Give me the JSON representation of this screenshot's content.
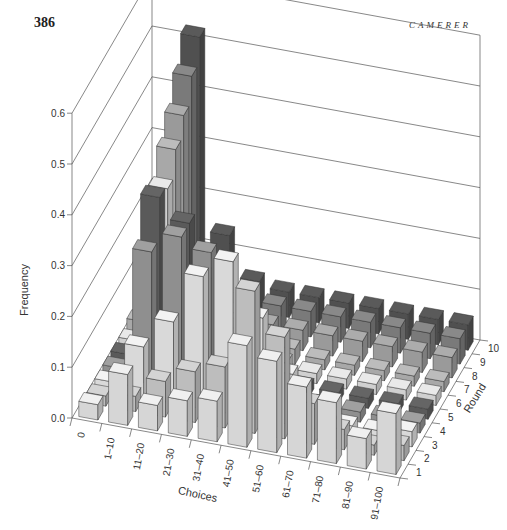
{
  "header": {
    "page_number": "386",
    "running_head": "CAMERER"
  },
  "caption": "",
  "chart_data": {
    "type": "bar3d",
    "title": "",
    "xlabel": "Choices",
    "ylabel": "Round",
    "zlabel": "Frequency",
    "x_categories": [
      "0",
      "1–10",
      "11–20",
      "21–30",
      "31–40",
      "41–50",
      "51–60",
      "61–70",
      "71–80",
      "81–90",
      "91–100"
    ],
    "y_categories": [
      "1",
      "2",
      "3",
      "4",
      "5",
      "6",
      "7",
      "8",
      "9",
      "10"
    ],
    "z_ticks": [
      "0.0",
      "0.1",
      "0.2",
      "0.3",
      "0.4",
      "0.5",
      "0.6"
    ],
    "zlim": [
      0,
      0.6
    ],
    "grid": true,
    "series": [
      {
        "name": "Round 1",
        "values": [
          0.03,
          0.1,
          0.05,
          0.07,
          0.08,
          0.2,
          0.18,
          0.14,
          0.12,
          0.06,
          0.12
        ]
      },
      {
        "name": "Round 2",
        "values": [
          0.02,
          0.03,
          0.07,
          0.1,
          0.12,
          0.28,
          0.2,
          0.08,
          0.04,
          0.02,
          0.03
        ]
      },
      {
        "name": "Round 3",
        "values": [
          0.02,
          0.1,
          0.16,
          0.26,
          0.3,
          0.2,
          0.1,
          0.04,
          0.02,
          0.02,
          0.03
        ]
      },
      {
        "name": "Round 4",
        "values": [
          0.02,
          0.26,
          0.3,
          0.28,
          0.14,
          0.08,
          0.04,
          0.02,
          0.02,
          0.02,
          0.02
        ]
      },
      {
        "name": "Round 5",
        "values": [
          0.02,
          0.34,
          0.3,
          0.2,
          0.1,
          0.04,
          0.02,
          0.02,
          0.02,
          0.02,
          0.02
        ]
      },
      {
        "name": "Round 6",
        "values": [
          0.02,
          0.33,
          0.16,
          0.1,
          0.05,
          0.03,
          0.02,
          0.02,
          0.02,
          0.02,
          0.02
        ]
      },
      {
        "name": "Round 7",
        "values": [
          0.03,
          0.38,
          0.12,
          0.06,
          0.04,
          0.03,
          0.02,
          0.02,
          0.02,
          0.02,
          0.02
        ]
      },
      {
        "name": "Round 8",
        "values": [
          0.04,
          0.42,
          0.08,
          0.05,
          0.04,
          0.04,
          0.04,
          0.04,
          0.04,
          0.04,
          0.04
        ]
      },
      {
        "name": "Round 9",
        "values": [
          0.05,
          0.47,
          0.1,
          0.06,
          0.05,
          0.05,
          0.05,
          0.05,
          0.05,
          0.05,
          0.05
        ]
      },
      {
        "name": "Round 10",
        "values": [
          0.06,
          0.52,
          0.14,
          0.06,
          0.05,
          0.05,
          0.05,
          0.05,
          0.05,
          0.05,
          0.05
        ]
      }
    ],
    "round_colors": [
      "#d6d6d6",
      "#bdbdbd",
      "#d9d9d9",
      "#8f8f8f",
      "#5a5a5a",
      "#d0d0d0",
      "#a8a8a8",
      "#9a9a9a",
      "#7a7a7a",
      "#505050"
    ]
  }
}
